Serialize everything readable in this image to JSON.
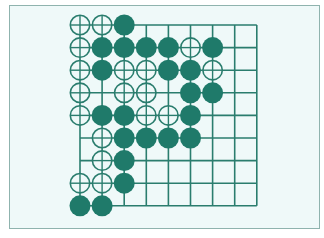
{
  "diagram": {
    "type": "go-board-fragment",
    "colors": {
      "line": "#2a7d6e",
      "black_stone": "#1f7a6a",
      "white_stone_fill": "#eff9f9",
      "background": "#eff9f9",
      "frame_border": "#8fb3ae"
    },
    "grid": {
      "columns": 9,
      "rows": 9,
      "origin_x": 80,
      "origin_y": 25,
      "spacing_x": 22.1,
      "spacing_y": 22.6,
      "stone_radius": 10.5
    },
    "legend": {
      "B": "black stone (filled)",
      "W": "white stone (hollow with crosshair)",
      ".": "empty point"
    },
    "rows": [
      "WWB......",
      "WBBBBWB..",
      "WBWWBBW..",
      "W.WW.BB..",
      "WBBWWB...",
      ".WBBBB...",
      ".WB......",
      "WWB......",
      "BB......."
    ]
  }
}
